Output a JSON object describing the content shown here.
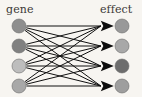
{
  "figure": {
    "type": "bipartite-directed-graph",
    "background_color": "#f7f5f1",
    "width": 142,
    "height": 97,
    "edge_color": "#111111",
    "node_stroke_color": "#6b6b6b"
  },
  "labels": {
    "left": "gene",
    "right": "effect"
  },
  "chart_data": {
    "type": "diagram",
    "title": "",
    "left_column_label": "gene",
    "right_column_label": "effect",
    "source_nodes": [
      {
        "id": "g1",
        "label": "",
        "x": 19,
        "y": 26,
        "r": 7,
        "color": "#8e8e8e"
      },
      {
        "id": "g2",
        "label": "",
        "x": 19,
        "y": 46,
        "r": 7,
        "color": "#808080"
      },
      {
        "id": "g3",
        "label": "",
        "x": 19,
        "y": 66,
        "r": 7,
        "color": "#bdbdbd"
      },
      {
        "id": "g4",
        "label": "",
        "x": 19,
        "y": 86,
        "r": 7,
        "color": "#a8a8a8"
      }
    ],
    "target_nodes": [
      {
        "id": "e1",
        "label": "",
        "x": 122,
        "y": 26,
        "r": 7,
        "color": "#999999"
      },
      {
        "id": "e2",
        "label": "",
        "x": 122,
        "y": 46,
        "r": 7,
        "color": "#a8a8a8"
      },
      {
        "id": "e3",
        "label": "",
        "x": 122,
        "y": 66,
        "r": 7,
        "color": "#6d6d6d"
      },
      {
        "id": "e4",
        "label": "",
        "x": 122,
        "y": 86,
        "r": 7,
        "color": "#9e9e9e"
      }
    ],
    "edges": [
      {
        "from": "g1",
        "to": "e1"
      },
      {
        "from": "g1",
        "to": "e2"
      },
      {
        "from": "g1",
        "to": "e3"
      },
      {
        "from": "g1",
        "to": "e4"
      },
      {
        "from": "g2",
        "to": "e1"
      },
      {
        "from": "g2",
        "to": "e2"
      },
      {
        "from": "g2",
        "to": "e3"
      },
      {
        "from": "g2",
        "to": "e4"
      },
      {
        "from": "g3",
        "to": "e1"
      },
      {
        "from": "g3",
        "to": "e2"
      },
      {
        "from": "g3",
        "to": "e3"
      },
      {
        "from": "g3",
        "to": "e4"
      },
      {
        "from": "g4",
        "to": "e1"
      },
      {
        "from": "g4",
        "to": "e2"
      },
      {
        "from": "g4",
        "to": "e3"
      },
      {
        "from": "g4",
        "to": "e4"
      }
    ],
    "edge_count": 16,
    "directed": true,
    "arrowheads_at": "target",
    "legend": [],
    "annotations": []
  }
}
